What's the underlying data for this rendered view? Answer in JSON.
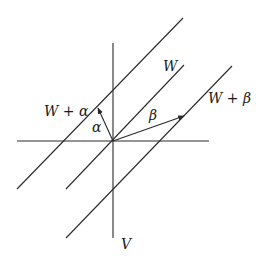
{
  "diagram": {
    "labels": {
      "w": "W",
      "w_plus_alpha": "W + α",
      "w_plus_beta": "W + β",
      "alpha": "α",
      "beta": "β",
      "v": "V"
    },
    "lines": [
      {
        "name": "horizontal-axis",
        "x1": 17,
        "y1": 141,
        "x2": 209,
        "y2": 141
      },
      {
        "name": "vertical-axis",
        "x1": 113,
        "y1": 43,
        "x2": 113,
        "y2": 238
      },
      {
        "name": "line-w-plus-alpha",
        "x1": 17,
        "y1": 189,
        "x2": 183,
        "y2": 18
      },
      {
        "name": "line-w",
        "x1": 66,
        "y1": 189,
        "x2": 184,
        "y2": 65
      },
      {
        "name": "line-w-plus-beta",
        "x1": 66,
        "y1": 238,
        "x2": 232,
        "y2": 66
      }
    ],
    "vectors": [
      {
        "name": "vector-alpha",
        "x1": 113,
        "y1": 141,
        "x2": 98,
        "y2": 108
      },
      {
        "name": "vector-beta",
        "x1": 113,
        "y1": 141,
        "x2": 184,
        "y2": 116
      }
    ],
    "colors": {
      "stroke": "#2a2a2a",
      "background": "#ffffff"
    }
  }
}
